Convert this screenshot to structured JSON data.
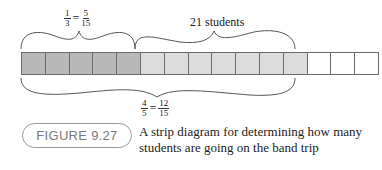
{
  "diagram": {
    "type": "strip-diagram",
    "total_parts": 15,
    "cells": [
      {
        "index": 1,
        "shade": "dark"
      },
      {
        "index": 2,
        "shade": "dark"
      },
      {
        "index": 3,
        "shade": "dark"
      },
      {
        "index": 4,
        "shade": "dark"
      },
      {
        "index": 5,
        "shade": "dark"
      },
      {
        "index": 6,
        "shade": "light"
      },
      {
        "index": 7,
        "shade": "light"
      },
      {
        "index": 8,
        "shade": "light"
      },
      {
        "index": 9,
        "shade": "light"
      },
      {
        "index": 10,
        "shade": "light"
      },
      {
        "index": 11,
        "shade": "light"
      },
      {
        "index": 12,
        "shade": "light"
      },
      {
        "index": 13,
        "shade": "white"
      },
      {
        "index": 14,
        "shade": "white"
      },
      {
        "index": 15,
        "shade": "white"
      }
    ],
    "colors": {
      "dark": "#b8b8b8",
      "light": "#dcdcdc",
      "white": "#ffffff",
      "border": "#6b6b6b",
      "brace": "#555555"
    },
    "top_left_label": {
      "lhs_num": "1",
      "lhs_den": "3",
      "rhs_num": "5",
      "rhs_den": "15"
    },
    "top_right_label": "21 students",
    "bottom_label": {
      "lhs_num": "4",
      "lhs_den": "5",
      "rhs_num": "12",
      "rhs_den": "15"
    }
  },
  "figure": {
    "badge": "FIGURE 9.27",
    "caption": "A strip diagram for determining how many students are going on the band trip"
  }
}
